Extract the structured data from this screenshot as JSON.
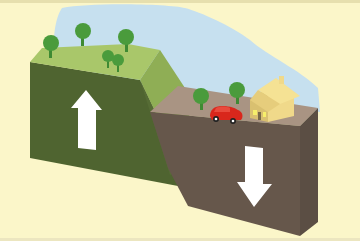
{
  "diagram": {
    "blocks": [
      {
        "name": "upthrown-block",
        "motion": "up",
        "arrow": "arrow-up-icon"
      },
      {
        "name": "downthrown-block",
        "motion": "down",
        "arrow": "arrow-down-icon"
      }
    ],
    "features": [
      "trees",
      "car",
      "house",
      "fault-scarp",
      "sky"
    ]
  },
  "colors": {
    "background": "#fbf6c9",
    "sky": "#c6e0ef",
    "grass_top": "#a9c76a",
    "scarp": "#8fae55",
    "green_front": "#4f6430",
    "tan_top": "#a99483",
    "brown_front": "#66574b",
    "brown_side": "#5b4e44",
    "tree": "#4a9b3c",
    "car": "#d9271c",
    "house": "#f0d98a",
    "house_side": "#d9c070",
    "arrow": "#ffffff"
  }
}
